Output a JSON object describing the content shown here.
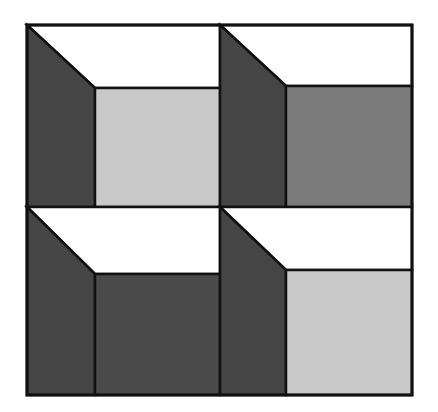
{
  "figure": {
    "outline_color": "#111111",
    "side_color": "#454545",
    "top_color": "#ffffff",
    "cells": [
      {
        "name": "top-left",
        "x": 27,
        "y": 25,
        "w": 193,
        "h": 182,
        "inner_x": 95,
        "inner_y": 88,
        "front_color": "#c9c9c9"
      },
      {
        "name": "top-right",
        "x": 220,
        "y": 25,
        "w": 192,
        "h": 182,
        "inner_x": 286,
        "inner_y": 86,
        "front_color": "#7b7b7b"
      },
      {
        "name": "bottom-left",
        "x": 27,
        "y": 207,
        "w": 193,
        "h": 188,
        "inner_x": 95,
        "inner_y": 274,
        "front_color": "#4b4b4b"
      },
      {
        "name": "bottom-right",
        "x": 220,
        "y": 207,
        "w": 192,
        "h": 188,
        "inner_x": 286,
        "inner_y": 270,
        "front_color": "#c9c9c9"
      }
    ]
  }
}
